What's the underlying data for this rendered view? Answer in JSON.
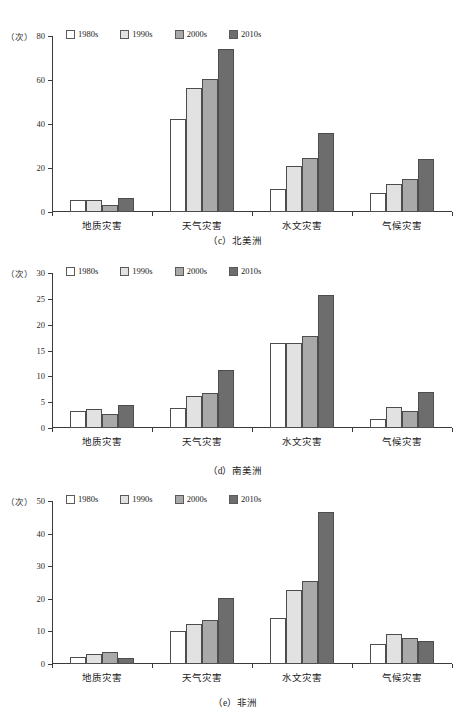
{
  "figure": {
    "series_colors": {
      "1980s": "#ffffff",
      "1990s": "#e2e2e2",
      "2000s": "#a9a9a9",
      "2010s": "#6d6d6d"
    },
    "axis_label": "（次）",
    "legend": [
      {
        "label": "1980s",
        "color": "#ffffff"
      },
      {
        "label": "1990s",
        "color": "#e2e2e2"
      },
      {
        "label": "2000s",
        "color": "#a9a9a9"
      },
      {
        "label": "2010s",
        "color": "#6d6d6d"
      }
    ]
  },
  "chart_data": [
    {
      "type": "bar",
      "title": "（c）北美洲",
      "caption": "（c）北美洲",
      "ylabel": "（次）",
      "xlabel": "",
      "ylim": [
        0,
        80
      ],
      "yticks": [
        0,
        20,
        40,
        60,
        80
      ],
      "ytick_labels": [
        "0",
        "20",
        "40",
        "60",
        "80"
      ],
      "grid": false,
      "legend_position": "top",
      "categories": [
        "地质灾害",
        "天气灾害",
        "水文灾害",
        "气候灾害"
      ],
      "series": [
        {
          "name": "1980s",
          "values": [
            5.3,
            42.5,
            10.5,
            8.8
          ]
        },
        {
          "name": "1990s",
          "values": [
            5.5,
            56.5,
            20.8,
            12.8
          ]
        },
        {
          "name": "2000s",
          "values": [
            3.0,
            60.5,
            24.7,
            14.8
          ]
        },
        {
          "name": "2010s",
          "values": [
            6.3,
            74.0,
            36.0,
            24.0
          ]
        }
      ]
    },
    {
      "type": "bar",
      "title": "（d）南美洲",
      "caption": "（d）南美洲",
      "ylabel": "（次）",
      "xlabel": "",
      "ylim": [
        0,
        30
      ],
      "yticks": [
        0,
        5,
        10,
        15,
        20,
        25,
        30
      ],
      "ytick_labels": [
        "0",
        "5",
        "10",
        "15",
        "20",
        "25",
        "30"
      ],
      "grid": false,
      "legend_position": "top",
      "categories": [
        "地质灾害",
        "天气灾害",
        "水文灾害",
        "气候灾害"
      ],
      "series": [
        {
          "name": "1980s",
          "values": [
            3.3,
            3.8,
            16.5,
            1.8
          ]
        },
        {
          "name": "1990s",
          "values": [
            3.7,
            6.2,
            16.5,
            4.0
          ]
        },
        {
          "name": "2000s",
          "values": [
            2.8,
            6.7,
            17.8,
            3.3
          ]
        },
        {
          "name": "2010s",
          "values": [
            4.4,
            11.2,
            25.7,
            7.0
          ]
        }
      ]
    },
    {
      "type": "bar",
      "title": "（e）非洲",
      "caption": "（e）非洲",
      "ylabel": "（次）",
      "xlabel": "",
      "ylim": [
        0,
        50
      ],
      "yticks": [
        0,
        10,
        20,
        30,
        40,
        50
      ],
      "ytick_labels": [
        "0",
        "10",
        "20",
        "30",
        "40",
        "50"
      ],
      "grid": false,
      "legend_position": "top",
      "categories": [
        "地质灾害",
        "天气灾害",
        "水文灾害",
        "气候灾害"
      ],
      "series": [
        {
          "name": "1980s",
          "values": [
            2.3,
            10.2,
            14.0,
            6.0
          ]
        },
        {
          "name": "1990s",
          "values": [
            3.2,
            12.3,
            22.8,
            9.2
          ]
        },
        {
          "name": "2000s",
          "values": [
            3.8,
            13.5,
            25.5,
            8.0
          ]
        },
        {
          "name": "2010s",
          "values": [
            1.8,
            20.2,
            46.5,
            7.0
          ]
        }
      ]
    }
  ]
}
